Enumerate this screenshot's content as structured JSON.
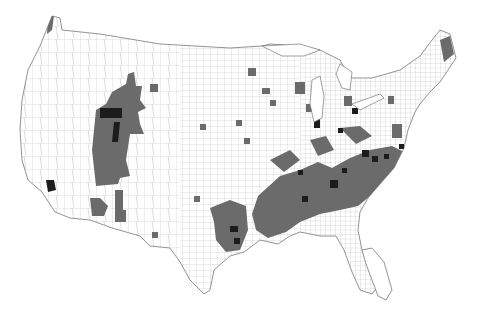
{
  "map": {
    "type": "choropleth",
    "subject": "United States counties",
    "legend": null,
    "colors": {
      "background": "#ffffff",
      "county_border": "#9a9a9a",
      "low": "#ffffff",
      "medium": "#6b6b6b",
      "high": "#1c1c1c"
    },
    "classes": [
      "low",
      "medium",
      "high"
    ],
    "highlighted_regions": [
      {
        "area": "Utah / southern Idaho / Arizona strip",
        "level": "medium"
      },
      {
        "area": "Salt Lake / Utah County",
        "level": "high"
      },
      {
        "area": "Los Angeles area",
        "level": "high"
      },
      {
        "area": "Southeastern Arizona",
        "level": "medium"
      },
      {
        "area": "Central Texas",
        "level": "medium"
      },
      {
        "area": "Lower Mississippi valley / Deep South",
        "level": "medium"
      },
      {
        "area": "Piedmont Carolinas / Georgia",
        "level": "medium"
      },
      {
        "area": "Atlanta / Charlotte / Raleigh / Nashville metros",
        "level": "high"
      },
      {
        "area": "Chicago / northwest Indiana",
        "level": "high"
      },
      {
        "area": "Puget Sound",
        "level": "medium"
      },
      {
        "area": "Maine coast",
        "level": "medium"
      },
      {
        "area": "North Florida / Gulf coast",
        "level": "medium"
      }
    ]
  }
}
